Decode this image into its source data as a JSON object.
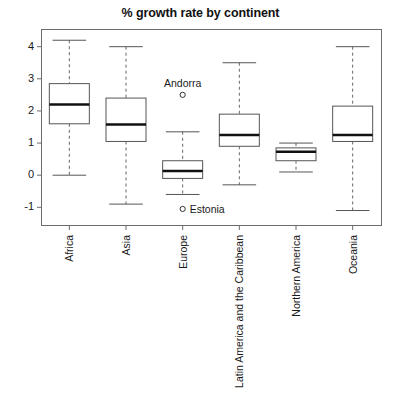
{
  "chart_data": {
    "type": "box",
    "title": "% growth rate by continent",
    "xlabel": "",
    "ylabel": "",
    "ylim": [
      -1.55,
      4.55
    ],
    "yticks": [
      4,
      3,
      2,
      1,
      0,
      -1
    ],
    "ytick_labels": [
      "4",
      "3",
      "2",
      "1",
      "0",
      "-1"
    ],
    "grid": false,
    "legend": "none",
    "categories": [
      "Africa",
      "Asia",
      "Europe",
      "Latin America and the Caribbean",
      "Northern America",
      "Oceania"
    ],
    "boxes": [
      {
        "name": "Africa",
        "whisker_low": 0.0,
        "q1": 1.6,
        "median": 2.2,
        "q3": 2.85,
        "whisker_high": 4.2,
        "outliers": []
      },
      {
        "name": "Asia",
        "whisker_low": -0.9,
        "q1": 1.05,
        "median": 1.58,
        "q3": 2.4,
        "whisker_high": 4.0,
        "outliers": []
      },
      {
        "name": "Europe",
        "whisker_low": -0.6,
        "q1": -0.1,
        "median": 0.13,
        "q3": 0.45,
        "whisker_high": 1.35,
        "outliers": [
          {
            "label": "Andorra",
            "value": 2.5,
            "label_position": "above"
          },
          {
            "label": "Estonia",
            "value": -1.05,
            "label_position": "right"
          }
        ]
      },
      {
        "name": "Latin America and the Caribbean",
        "whisker_low": -0.3,
        "q1": 0.9,
        "median": 1.25,
        "q3": 1.9,
        "whisker_high": 3.5,
        "outliers": []
      },
      {
        "name": "Northern America",
        "whisker_low": 0.1,
        "q1": 0.45,
        "median": 0.73,
        "q3": 0.85,
        "whisker_high": 1.0,
        "outliers": []
      },
      {
        "name": "Oceania",
        "whisker_low": -1.1,
        "q1": 1.05,
        "median": 1.25,
        "q3": 2.15,
        "whisker_high": 4.0,
        "outliers": []
      }
    ]
  },
  "colors": {
    "background": "#ffffff",
    "frame": "#6b6b6b",
    "box_stroke": "#555555",
    "median": "#111111",
    "whisker": "#666666",
    "text": "#1a1a1a"
  }
}
